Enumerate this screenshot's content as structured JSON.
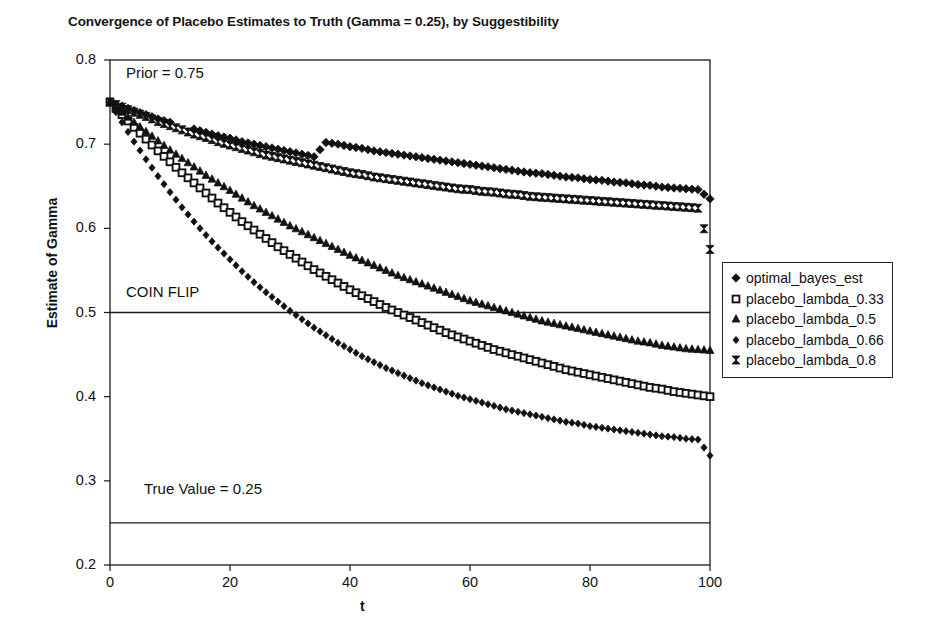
{
  "chart_data": {
    "type": "scatter",
    "title": "Convergence of Placebo Estimates to Truth (Gamma = 0.25), by Suggestibility",
    "xlabel": "t",
    "ylabel": "Estimate of Gamma",
    "xlim": [
      0,
      100
    ],
    "ylim": [
      0.2,
      0.8
    ],
    "xticks": [
      0,
      20,
      40,
      60,
      80,
      100
    ],
    "yticks": [
      0.2,
      0.3,
      0.4,
      0.5,
      0.6,
      0.7,
      0.8
    ],
    "xtick_labels": [
      "0",
      "20",
      "40",
      "60",
      "80",
      "100"
    ],
    "ytick_labels": [
      "0.2",
      "0.3",
      "0.4",
      "0.5",
      "0.6",
      "0.7",
      "0.8"
    ],
    "grid": false,
    "legend_position": "right",
    "prior": 0.75,
    "true_value": 0.25,
    "reference_lines": [
      {
        "name": "coin-flip-line",
        "y": 0.5,
        "label": "COIN FLIP"
      },
      {
        "name": "true-value-line",
        "y": 0.25,
        "label": "True Value = 0.25"
      }
    ],
    "annotations": [
      {
        "name": "prior-annotation",
        "text": "Prior = 0.75",
        "x": 2,
        "y": 0.782
      },
      {
        "name": "coin-flip-annotation",
        "text": "COIN FLIP",
        "x": 2,
        "y": 0.522
      },
      {
        "name": "true-value-annotation",
        "text": "True Value = 0.25",
        "x": 5,
        "y": 0.288
      }
    ],
    "x": [
      0,
      2,
      4,
      6,
      8,
      10,
      12,
      14,
      16,
      18,
      20,
      22,
      24,
      26,
      28,
      30,
      32,
      34,
      36,
      38,
      40,
      42,
      44,
      46,
      48,
      50,
      52,
      54,
      56,
      58,
      60,
      62,
      64,
      66,
      68,
      70,
      72,
      74,
      76,
      78,
      80,
      82,
      84,
      86,
      88,
      90,
      92,
      94,
      96,
      98,
      100
    ],
    "series": [
      {
        "name": "optimal_bayes_est",
        "marker": "diamond-filled",
        "values": [
          0.75,
          0.745,
          0.74,
          0.735,
          0.73,
          0.726,
          0.922,
          0.718,
          0.714,
          0.71,
          0.707,
          0.703,
          0.7,
          0.697,
          0.694,
          0.691,
          0.688,
          0.685,
          0.702,
          0.7,
          0.697,
          0.695,
          0.692,
          0.69,
          0.688,
          0.686,
          0.684,
          0.682,
          0.68,
          0.678,
          0.676,
          0.674,
          0.672,
          0.67,
          0.668,
          0.666,
          0.665,
          0.663,
          0.661,
          0.66,
          0.658,
          0.657,
          0.655,
          0.654,
          0.652,
          0.651,
          0.649,
          0.648,
          0.647,
          0.646,
          0.635
        ]
      },
      {
        "name": "placebo_lambda_0.33",
        "marker": "square-open",
        "values": [
          0.75,
          0.735,
          0.72,
          0.706,
          0.692,
          0.679,
          0.666,
          0.654,
          0.642,
          0.63,
          0.619,
          0.608,
          0.598,
          0.588,
          0.578,
          0.569,
          0.56,
          0.551,
          0.543,
          0.535,
          0.527,
          0.52,
          0.513,
          0.506,
          0.5,
          0.494,
          0.488,
          0.482,
          0.476,
          0.471,
          0.466,
          0.461,
          0.456,
          0.452,
          0.448,
          0.444,
          0.44,
          0.436,
          0.432,
          0.429,
          0.426,
          0.423,
          0.42,
          0.417,
          0.414,
          0.411,
          0.409,
          0.406,
          0.404,
          0.402,
          0.4
        ]
      },
      {
        "name": "placebo_lambda_0.5",
        "marker": "triangle-filled",
        "values": [
          0.75,
          0.738,
          0.726,
          0.715,
          0.704,
          0.693,
          0.683,
          0.673,
          0.663,
          0.654,
          0.645,
          0.636,
          0.627,
          0.619,
          0.611,
          0.603,
          0.596,
          0.589,
          0.582,
          0.575,
          0.568,
          0.562,
          0.556,
          0.55,
          0.544,
          0.539,
          0.534,
          0.529,
          0.524,
          0.519,
          0.514,
          0.51,
          0.506,
          0.502,
          0.498,
          0.494,
          0.49,
          0.487,
          0.484,
          0.481,
          0.478,
          0.475,
          0.472,
          0.469,
          0.466,
          0.464,
          0.461,
          0.459,
          0.457,
          0.456,
          0.455
        ]
      },
      {
        "name": "placebo_lambda_0.66",
        "marker": "diamond-small",
        "values": [
          0.75,
          0.726,
          0.703,
          0.682,
          0.662,
          0.643,
          0.625,
          0.608,
          0.592,
          0.577,
          0.563,
          0.549,
          0.536,
          0.524,
          0.513,
          0.502,
          0.492,
          0.482,
          0.473,
          0.464,
          0.456,
          0.448,
          0.441,
          0.434,
          0.428,
          0.422,
          0.416,
          0.411,
          0.406,
          0.401,
          0.397,
          0.393,
          0.389,
          0.385,
          0.382,
          0.379,
          0.376,
          0.373,
          0.37,
          0.368,
          0.365,
          0.363,
          0.361,
          0.359,
          0.357,
          0.355,
          0.353,
          0.352,
          0.35,
          0.349,
          0.33
        ]
      },
      {
        "name": "placebo_lambda_0.8",
        "marker": "bowtie-filled",
        "values": [
          0.75,
          0.744,
          0.738,
          0.733,
          0.727,
          0.722,
          0.717,
          0.712,
          0.708,
          0.703,
          0.699,
          0.695,
          0.691,
          0.687,
          0.684,
          0.681,
          0.678,
          0.675,
          0.672,
          0.669,
          0.666,
          0.664,
          0.661,
          0.659,
          0.657,
          0.655,
          0.653,
          0.651,
          0.649,
          0.647,
          0.646,
          0.644,
          0.643,
          0.641,
          0.64,
          0.638,
          0.637,
          0.636,
          0.635,
          0.634,
          0.633,
          0.632,
          0.631,
          0.63,
          0.629,
          0.628,
          0.627,
          0.626,
          0.625,
          0.624,
          0.575
        ]
      }
    ],
    "legend": [
      {
        "label": "optimal_bayes_est",
        "marker": "diamond-filled"
      },
      {
        "label": "placebo_lambda_0.33",
        "marker": "square-open"
      },
      {
        "label": "placebo_lambda_0.5",
        "marker": "triangle-filled"
      },
      {
        "label": "placebo_lambda_0.66",
        "marker": "diamond-small"
      },
      {
        "label": "placebo_lambda_0.8",
        "marker": "bowtie-filled"
      }
    ]
  }
}
